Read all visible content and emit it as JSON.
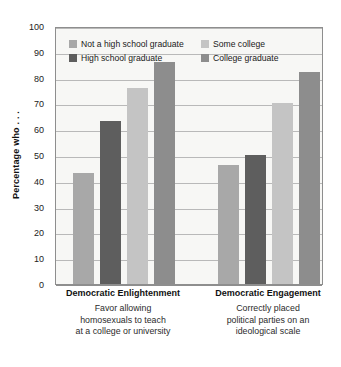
{
  "chart_data": {
    "type": "bar",
    "title": "",
    "xlabel": "",
    "ylabel": "Percentage who . . .",
    "ylim": [
      0,
      100
    ],
    "ytick_step": 10,
    "yticks": [
      100,
      90,
      80,
      70,
      60,
      50,
      40,
      30,
      20,
      10,
      0
    ],
    "grid": true,
    "legend_position": "inside-top",
    "categories": [
      "Democratic Enlightenment",
      "Democratic Engagement"
    ],
    "category_subtitles": [
      [
        "Favor allowing",
        "homosexuals to teach",
        "at a college or university"
      ],
      [
        "Correctly placed",
        "political parties on an",
        "ideological scale"
      ]
    ],
    "series": [
      {
        "name": "Not a high school graduate",
        "color": "#a8a8a8",
        "values": [
          43,
          46
        ]
      },
      {
        "name": "High school graduate",
        "color": "#5e5e5e",
        "values": [
          63,
          50
        ]
      },
      {
        "name": "Some college",
        "color": "#c4c4c4",
        "values": [
          76,
          70
        ]
      },
      {
        "name": "College graduate",
        "color": "#8d8d8d",
        "values": [
          86,
          82
        ]
      }
    ]
  },
  "legend": {
    "entries": [
      {
        "label": "Not a high school graduate",
        "color": "#a8a8a8"
      },
      {
        "label": "Some college",
        "color": "#c4c4c4"
      },
      {
        "label": "High school graduate",
        "color": "#5e5e5e"
      },
      {
        "label": "College graduate",
        "color": "#8d8d8d"
      }
    ]
  },
  "colors": {
    "plot_background": "#f7f7f5",
    "plot_border": "#8e8e8e",
    "gridline": "#b9b9b9",
    "text": "#1a1a1a"
  }
}
